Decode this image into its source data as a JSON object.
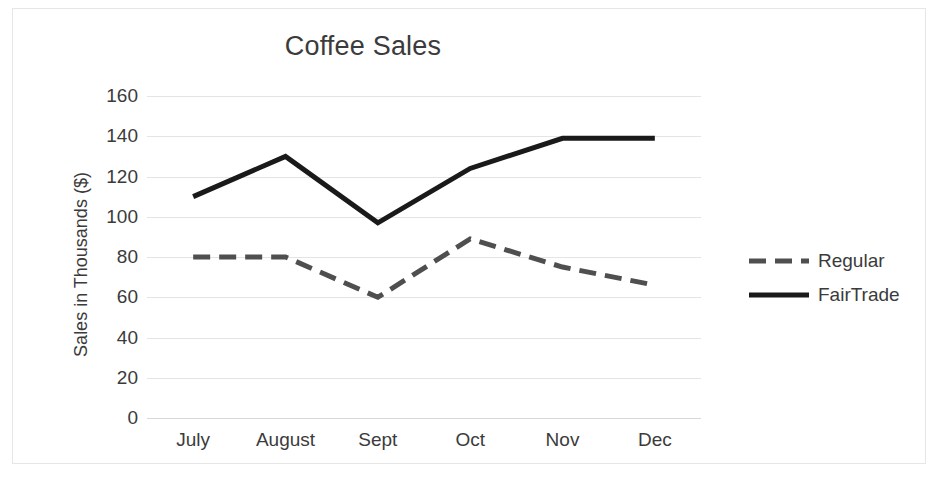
{
  "chart_data": {
    "type": "line",
    "title": "Coffee Sales",
    "xlabel": "",
    "ylabel": "Sales in Thousands ($)",
    "categories": [
      "July",
      "August",
      "Sept",
      "Oct",
      "Nov",
      "Dec"
    ],
    "ylim": [
      0,
      160
    ],
    "ytick_values": [
      0,
      20,
      40,
      60,
      80,
      100,
      120,
      140,
      160
    ],
    "ytick_labels": [
      "0",
      "20",
      "40",
      "60",
      "80",
      "100",
      "120",
      "140",
      "160"
    ],
    "grid": true,
    "legend_position": "right",
    "series": [
      {
        "name": "Regular",
        "values": [
          80,
          80,
          60,
          89,
          75,
          66
        ],
        "color": "#4f4f4f",
        "style": "dashed",
        "width": 5
      },
      {
        "name": "FairTrade",
        "values": [
          110,
          130,
          97,
          124,
          139,
          139
        ],
        "color": "#1a1a1a",
        "style": "solid",
        "width": 5
      }
    ]
  },
  "legend": {
    "items": [
      {
        "label": "Regular"
      },
      {
        "label": "FairTrade"
      }
    ]
  },
  "colors": {
    "frame_border": "#e6e6e6",
    "gridline": "#e4e4e4",
    "text": "#3b3b3b",
    "background": "#ffffff"
  }
}
